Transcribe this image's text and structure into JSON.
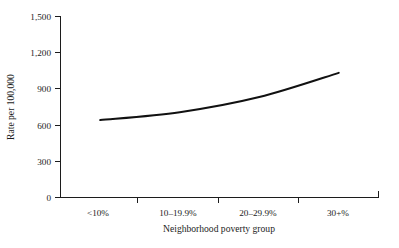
{
  "chart_data": {
    "type": "line",
    "title": "",
    "xlabel": "Neighborhood poverty group",
    "ylabel": "Rate per 100,000",
    "categories": [
      "<10%",
      "10–19.9%",
      "20–29.9%",
      "30+%"
    ],
    "values": [
      640,
      705,
      830,
      1030
    ],
    "series": [
      {
        "name": "Rate",
        "values": [
          640,
          705,
          830,
          1030
        ],
        "color": "#111111"
      }
    ],
    "ylim": [
      0,
      1500
    ],
    "yticks": [
      0,
      300,
      600,
      900,
      1200,
      1500
    ],
    "ytick_labels": [
      "0",
      "300",
      "600",
      "900",
      "1,200",
      "1,500"
    ],
    "xtick_labels": [
      "<10%",
      "10–19.9%",
      "20–29.9%",
      "30+%"
    ],
    "grid": false,
    "legend": false,
    "legend_position": "none",
    "line_style": "solid",
    "markers": "none",
    "background_color": "#ffffff",
    "axis_color": "#1c1c1c"
  },
  "labels": {
    "y_axis_title": "Rate per 100,000",
    "x_axis_title": "Neighborhood poverty group",
    "y_tick_0": "0",
    "y_tick_1": "300",
    "y_tick_2": "600",
    "y_tick_3": "900",
    "y_tick_4": "1,200",
    "y_tick_5": "1,500",
    "x_tick_0": "<10%",
    "x_tick_1": "10–19.9%",
    "x_tick_2": "20–29.9%",
    "x_tick_3": "30+%"
  }
}
